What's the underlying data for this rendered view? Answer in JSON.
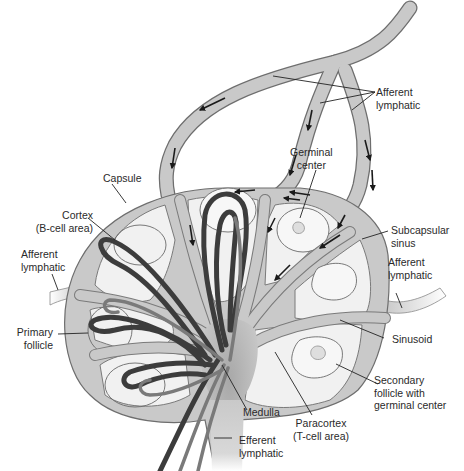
{
  "figure": {
    "colors": {
      "vessel_fill": "#c9c9c9",
      "vessel_stroke": "#6e6e6e",
      "parenchyma": "#f1f1f1",
      "blood_vessel_dark": "#3c3c3c",
      "blood_vessel_mid": "#7a7a7a",
      "arrow": "#1a1a1a",
      "label_text": "#2a2a2a",
      "leader_line": "#222222"
    }
  },
  "labels": {
    "afferent_top": "Afferent\nlymphatic",
    "germinal_center": "Germinal\ncenter",
    "capsule": "Capsule",
    "cortex": "Cortex\n(B-cell area)",
    "afferent_left": "Afferent\nlymphatic",
    "subcapsular_sinus": "Subcapsular\nsinus",
    "afferent_right": "Afferent\nlymphatic",
    "primary_follicle": "Primary\nfollicle",
    "sinusoid": "Sinusoid",
    "secondary_follicle": "Secondary\nfollicle with\ngerminal center",
    "medulla": "Medulla",
    "paracortex": "Paracortex\n(T-cell area)",
    "efferent": "Efferent\nlymphatic"
  }
}
